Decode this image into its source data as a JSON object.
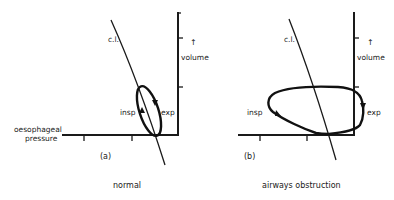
{
  "figure": {
    "axis_x_label_line1": "oesophageal",
    "axis_x_label_line2": "pressure",
    "axis_y_arrow": "↑",
    "colors": {
      "ink": "#1a1a1a",
      "background": "#ffffff"
    }
  },
  "panels": [
    {
      "id": "a",
      "letter": "(a)",
      "caption": "normal",
      "compliance_label": "c.l.",
      "insp_label": "insp",
      "exp_label": "exp",
      "y_arrow": "↑",
      "y_label": "volume"
    },
    {
      "id": "b",
      "letter": "(b)",
      "caption": "airways obstruction",
      "compliance_label": "c.l.",
      "insp_label": "insp",
      "exp_label": "exp",
      "y_arrow": "↑",
      "y_label": "volume"
    }
  ]
}
